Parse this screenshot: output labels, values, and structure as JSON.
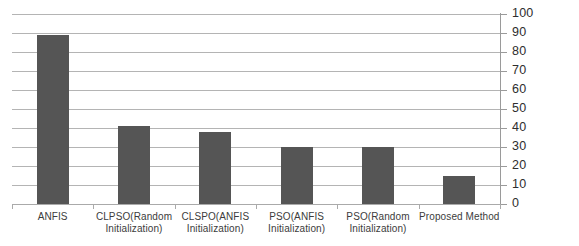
{
  "chart_data": {
    "type": "bar",
    "title": "",
    "subtitle": "",
    "xlabel": "",
    "ylabel": "",
    "ylim": [
      0,
      100
    ],
    "ytick_step": 10,
    "yticks": [
      "0",
      "10",
      "20",
      "30",
      "40",
      "50",
      "60",
      "70",
      "80",
      "90",
      "100"
    ],
    "grid": true,
    "grid_axis": "y",
    "y_axis_position": "right",
    "legend": null,
    "legend_position": "none",
    "bar_color": "#555555",
    "gridline_color": "#b4b4b4",
    "categories": [
      "ANFIS",
      "CLPSO(Random Initialization)",
      "CLSPO(ANFIS Initialization)",
      "PSO(ANFIS Initialization)",
      "PSO(Random Initialization)",
      "Proposed Method"
    ],
    "category_lines": [
      [
        "ANFIS",
        ""
      ],
      [
        "CLPSO(Random",
        "Initialization)"
      ],
      [
        "CLSPO(ANFIS",
        "Initialization)"
      ],
      [
        "PSO(ANFIS",
        "Initialization)"
      ],
      [
        "PSO(Random",
        "Initialization)"
      ],
      [
        "Proposed Method",
        ""
      ]
    ],
    "values": [
      89,
      41,
      38,
      30,
      30,
      15
    ]
  }
}
